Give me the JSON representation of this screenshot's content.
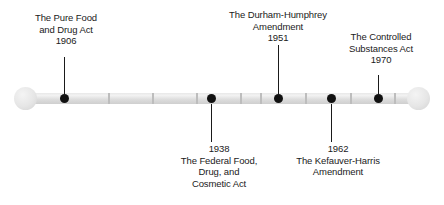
{
  "figure": {
    "kind": "horizontal-timeline",
    "orientation": "horizontal"
  },
  "rail": {
    "ticks": [
      108,
      152,
      196,
      240,
      260,
      305,
      350,
      394
    ]
  },
  "events": [
    {
      "id": "pure-food-drug-act-1906",
      "year": "1906",
      "title_lines": [
        "The Pure Food",
        "and Drug Act"
      ],
      "side": "above",
      "dot_x": 64,
      "label_center_x": 66,
      "label_top": 12,
      "stem_top": 57,
      "stem_bottom": 96
    },
    {
      "id": "federal-food-drug-cosmetic-act-1938",
      "year": "1938",
      "title_lines": [
        "The Federal Food,",
        "Drug, and",
        "Cosmetic Act"
      ],
      "side": "below",
      "dot_x": 211,
      "label_center_x": 219,
      "label_top": 143,
      "stem_top": 104,
      "stem_bottom": 142
    },
    {
      "id": "durham-humphrey-amendment-1951",
      "year": "1951",
      "title_lines": [
        "The Durham-Humphrey",
        "Amendment"
      ],
      "side": "above",
      "dot_x": 278,
      "label_center_x": 278,
      "label_top": 9,
      "stem_top": 45,
      "stem_bottom": 96
    },
    {
      "id": "kefauver-harris-amendment-1962",
      "year": "1962",
      "title_lines": [
        "The Kefauver-Harris",
        "Amendment"
      ],
      "side": "below",
      "dot_x": 331,
      "label_center_x": 338,
      "label_top": 143,
      "stem_top": 104,
      "stem_bottom": 142
    },
    {
      "id": "controlled-substances-act-1970",
      "year": "1970",
      "title_lines": [
        "The Controlled",
        "Substances Act"
      ],
      "side": "above",
      "dot_x": 378,
      "label_center_x": 381,
      "label_top": 31,
      "stem_top": 75,
      "stem_bottom": 96
    }
  ],
  "colors": {
    "text": "#1a1a1a",
    "dot": "#111111",
    "rail_light": "#f2f2f2",
    "rail_dark": "#cfcfcf",
    "tick": "#bdbdbd",
    "background": "#ffffff"
  }
}
